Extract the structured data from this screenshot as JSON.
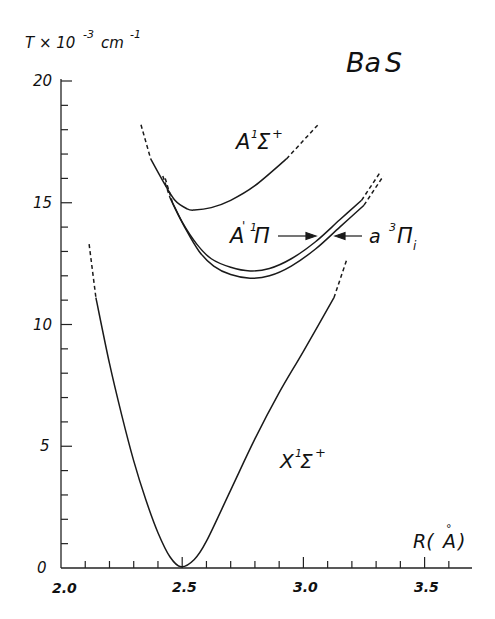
{
  "chart_data": {
    "type": "line",
    "title": "Ba S",
    "xlabel": "R(Å)",
    "ylabel": "T × 10^-3 cm^-1",
    "ylabel_parts": {
      "base": "T × 10",
      "exp": "-3",
      "unit": " cm",
      "unit_exp": "-1"
    },
    "xlim": [
      2.0,
      3.7
    ],
    "ylim": [
      0,
      20
    ],
    "x_ticks": [
      2.0,
      2.5,
      3.0,
      3.5
    ],
    "x_tick_labels": [
      "2.0",
      "2.5",
      "3.0",
      "3.5"
    ],
    "x_minor_step": 0.1,
    "y_ticks": [
      0,
      5,
      10,
      15,
      20
    ],
    "y_tick_labels": [
      "0",
      "5",
      "10",
      "15",
      "20"
    ],
    "y_minor_step": 1,
    "grid": false,
    "legend": "none (curves labelled inline)",
    "series": [
      {
        "name": "X¹Σ⁺",
        "label_main": "X",
        "label_sup": "1",
        "label_sym": "Σ",
        "label_sup2": "+",
        "solid": [
          [
            2.144,
            11.1
          ],
          [
            2.2,
            8.4
          ],
          [
            2.25,
            6.3
          ],
          [
            2.3,
            4.4
          ],
          [
            2.35,
            2.8
          ],
          [
            2.4,
            1.45
          ],
          [
            2.45,
            0.45
          ],
          [
            2.495,
            0.05
          ],
          [
            2.55,
            0.35
          ],
          [
            2.6,
            1.1
          ],
          [
            2.7,
            3.2
          ],
          [
            2.8,
            5.3
          ],
          [
            2.9,
            7.2
          ],
          [
            3.0,
            8.9
          ],
          [
            3.126,
            11.1
          ]
        ],
        "dashed_left": [
          [
            2.116,
            13.3
          ],
          [
            2.144,
            11.1
          ]
        ],
        "dashed_right": [
          [
            3.126,
            11.1
          ],
          [
            3.18,
            12.7
          ]
        ]
      },
      {
        "name": "A¹Σ⁺",
        "label_main": "A",
        "label_sup": "1",
        "label_sym": "Σ",
        "label_sup2": "+",
        "solid": [
          [
            2.37,
            16.8
          ],
          [
            2.42,
            15.9
          ],
          [
            2.47,
            15.1
          ],
          [
            2.52,
            14.75
          ],
          [
            2.55,
            14.7
          ],
          [
            2.62,
            14.8
          ],
          [
            2.7,
            15.1
          ],
          [
            2.8,
            15.7
          ],
          [
            2.93,
            16.8
          ]
        ],
        "dashed_left": [
          [
            2.33,
            18.2
          ],
          [
            2.37,
            16.8
          ]
        ],
        "dashed_right": [
          [
            2.93,
            16.8
          ],
          [
            3.06,
            18.2
          ]
        ]
      },
      {
        "name": "A'¹Π",
        "label_main": "A'",
        "label_sup": "1",
        "label_sym": "Π",
        "label_sup2": "",
        "solid": [
          [
            2.45,
            15.2
          ],
          [
            2.5,
            14.2
          ],
          [
            2.56,
            13.3
          ],
          [
            2.62,
            12.7
          ],
          [
            2.7,
            12.35
          ],
          [
            2.78,
            12.2
          ],
          [
            2.86,
            12.3
          ],
          [
            2.95,
            12.7
          ],
          [
            3.05,
            13.4
          ],
          [
            3.15,
            14.3
          ],
          [
            3.24,
            15.1
          ]
        ],
        "dashed_left": [
          [
            2.42,
            16.1
          ],
          [
            2.45,
            15.2
          ]
        ],
        "dashed_right": [
          [
            3.24,
            15.1
          ],
          [
            3.32,
            16.3
          ]
        ]
      },
      {
        "name": "a³Πi",
        "label_main": "a",
        "label_sup": "3",
        "label_sym": "Π",
        "label_sub": "i",
        "solid": [
          [
            2.46,
            15.0
          ],
          [
            2.51,
            14.0
          ],
          [
            2.57,
            13.0
          ],
          [
            2.63,
            12.4
          ],
          [
            2.7,
            12.05
          ],
          [
            2.78,
            11.9
          ],
          [
            2.86,
            12.0
          ],
          [
            2.95,
            12.4
          ],
          [
            3.05,
            13.1
          ],
          [
            3.15,
            14.0
          ],
          [
            3.25,
            14.9
          ]
        ],
        "dashed_left": [
          [
            2.43,
            16.0
          ],
          [
            2.46,
            15.0
          ]
        ],
        "dashed_right": [
          [
            3.25,
            14.9
          ],
          [
            3.33,
            16.1
          ]
        ]
      }
    ],
    "annotations": [
      {
        "text": "A'¹Π →",
        "points_to": "A'¹Π curve"
      },
      {
        "text": "← a³Πi",
        "points_to": "a³Πi curve"
      }
    ]
  },
  "labels": {
    "title_ba": "Ba",
    "title_s": "S",
    "ylabel_base": "T × 10",
    "ylabel_exp": "-3",
    "ylabel_unit": "cm",
    "ylabel_unit_exp": "-1",
    "xlabel_r": "R(",
    "xlabel_a": "A",
    "xlabel_ring": "°",
    "xlabel_close": ")",
    "x_tick_0": "2.0",
    "x_tick_1": "2.5",
    "x_tick_2": "3.0",
    "x_tick_3": "3.5",
    "y_tick_0": "0",
    "y_tick_1": "5",
    "y_tick_2": "10",
    "y_tick_3": "15",
    "y_tick_4": "20",
    "X_main": "X",
    "X_sup": "1",
    "X_sym": "Σ",
    "X_sup2": "+",
    "A_main": "A",
    "A_sup": "1",
    "A_sym": "Σ",
    "A_sup2": "+",
    "Ap_main": "A",
    "Ap_prime": "'",
    "Ap_sup": "1",
    "Ap_sym": "Π",
    "a_main": "a",
    "a_sup": "3",
    "a_sym": "Π",
    "a_sub": "i"
  }
}
